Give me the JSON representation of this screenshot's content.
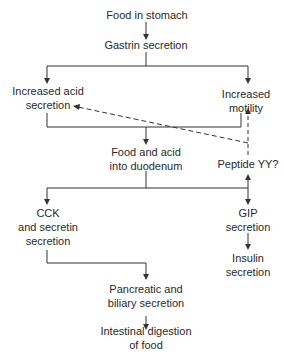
{
  "diagram": {
    "nodes": {
      "food_in_stomach": "Food in stomach",
      "gastrin": "Gastrin secretion",
      "acid_1": "Increased acid",
      "acid_2": "secretion",
      "motility_1": "Increased",
      "motility_2": "motility",
      "duodenum_1": "Food and acid",
      "duodenum_2": "into duodenum",
      "peptide_yy": "Peptide YY?",
      "cck_1": "CCK",
      "cck_2": "and secretin",
      "cck_3": "secretion",
      "gip_1": "GIP",
      "gip_2": "secretion",
      "insulin_1": "Insulin",
      "insulin_2": "secretion",
      "pancreatic_1": "Pancreatic and",
      "pancreatic_2": "biliary secretion",
      "intestinal_1": "Intestinal digestion",
      "intestinal_2": "of food"
    },
    "edges": [
      {
        "from": "Food in stomach",
        "to": "Gastrin secretion",
        "style": "solid"
      },
      {
        "from": "Gastrin secretion",
        "to": "Increased acid secretion",
        "style": "solid"
      },
      {
        "from": "Gastrin secretion",
        "to": "Increased motility",
        "style": "solid"
      },
      {
        "from": "Increased acid secretion + Increased motility",
        "to": "Food and acid into duodenum",
        "style": "solid"
      },
      {
        "from": "Food and acid into duodenum",
        "to": "CCK and secretin secretion",
        "style": "solid"
      },
      {
        "from": "Food and acid into duodenum",
        "to": "GIP secretion",
        "style": "solid"
      },
      {
        "from": "Food and acid into duodenum",
        "to": "Peptide YY?",
        "style": "solid"
      },
      {
        "from": "Peptide YY?",
        "to": "Increased acid secretion",
        "style": "dashed"
      },
      {
        "from": "Peptide YY?",
        "to": "Increased motility",
        "style": "dashed"
      },
      {
        "from": "GIP secretion",
        "to": "Insulin secretion",
        "style": "solid"
      },
      {
        "from": "CCK and secretin secretion",
        "to": "Pancreatic and biliary secretion",
        "style": "solid"
      },
      {
        "from": "Pancreatic and biliary secretion",
        "to": "Intestinal digestion of food",
        "style": "solid"
      }
    ],
    "colors": {
      "line": "#333333",
      "text": "#2a2a2a",
      "background": "#ffffff"
    }
  }
}
